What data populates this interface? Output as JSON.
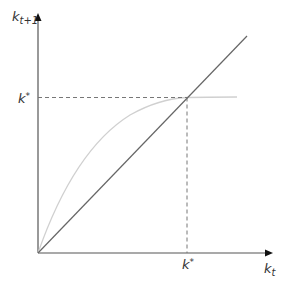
{
  "diagram": {
    "y_axis": {
      "label_base": "k",
      "label_sub": "t+1"
    },
    "x_axis": {
      "label_base": "k",
      "label_sub": "t"
    },
    "steady_state_y": {
      "label_base": "k",
      "label_sup": "*"
    },
    "steady_state_x": {
      "label_base": "k",
      "label_sup": "*"
    },
    "elements": [
      "45-degree line k_{t+1} = k_t",
      "concave accumulation curve",
      "dashed guide lines to steady state k*"
    ],
    "colors": {
      "axis": "#555555",
      "diagonal": "#666666",
      "curve": "#d0d0d0",
      "dashed": "#777777",
      "text": "#333333"
    }
  }
}
